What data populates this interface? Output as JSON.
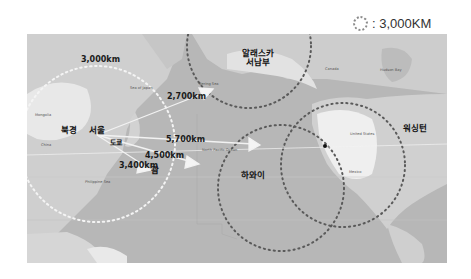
{
  "legend": {
    "icon": "dotted-circle-icon",
    "text": ": 3,000KM"
  },
  "map": {
    "region": "North Pacific",
    "origin": "서울",
    "cities": {
      "beijing": "북경",
      "seoul": "서울",
      "tokyo": "도쿄",
      "guam": "괌",
      "hawaii": "하와이",
      "alaska": "알래스카\n서남부",
      "washington": "워싱턴"
    },
    "distances": {
      "radius": "3,000km",
      "alaska": "2,700km",
      "hawaii": "5,700km",
      "pacific": "4,500km",
      "guam": "3,400km"
    },
    "basemap_labels": {
      "mongolia": "Mongolia",
      "china": "China",
      "sea_of_japan": "Sea of Japan",
      "bering": "Bering Sea",
      "north_pacific": "North Pacific Ocean",
      "philippine_sea": "Philippine Sea",
      "canada": "Canada",
      "hudson_bay": "Hudson Bay",
      "united_states": "United States",
      "mexico": "Mexico"
    },
    "colors": {
      "ocean": "#b9b9b9",
      "land": "#d6d6d6",
      "snow_land": "#ececec",
      "dotted_circle": "#5a5a5a",
      "white_circle": "#f4f4f4",
      "arrow": "#f2f2f2"
    }
  }
}
